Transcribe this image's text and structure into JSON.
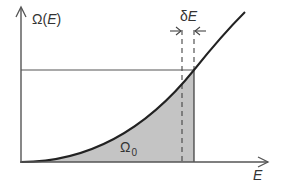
{
  "figure": {
    "type": "density-of-states-diagram",
    "y_axis_label_prefix": "Ω",
    "y_axis_label_open": "(",
    "y_axis_label_var": "E",
    "y_axis_label_close": ")",
    "x_axis_label": "E",
    "delta_label_prefix": "δ",
    "delta_label_var": "E",
    "area_label_main": "Ω",
    "area_label_sub": "0",
    "colors": {
      "axis": "#555555",
      "curve": "#222222",
      "fill": "#c4c4c4",
      "text": "#333333",
      "background": "#ffffff"
    }
  }
}
